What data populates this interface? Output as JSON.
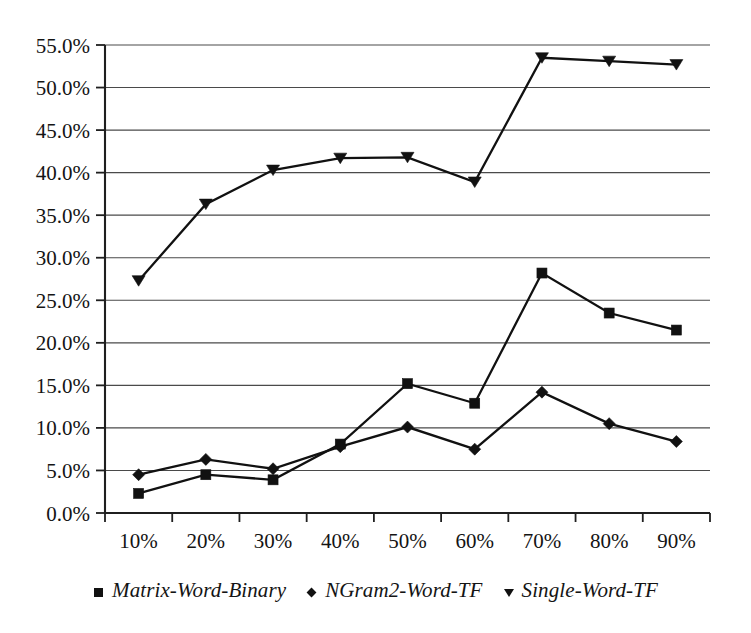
{
  "chart_data": {
    "type": "line",
    "title": "",
    "xlabel": "",
    "ylabel": "",
    "categories": [
      "10%",
      "20%",
      "30%",
      "40%",
      "50%",
      "60%",
      "70%",
      "80%",
      "90%"
    ],
    "x_values": [
      10,
      20,
      30,
      40,
      50,
      60,
      70,
      80,
      90
    ],
    "ylim": [
      0,
      55
    ],
    "ytick_labels": [
      "0.0%",
      "5.0%",
      "10.0%",
      "15.0%",
      "20.0%",
      "25.0%",
      "30.0%",
      "35.0%",
      "40.0%",
      "45.0%",
      "50.0%",
      "55.0%"
    ],
    "ytick_values": [
      0,
      5,
      10,
      15,
      20,
      25,
      30,
      35,
      40,
      45,
      50,
      55
    ],
    "grid": true,
    "legend_position": "bottom",
    "series": [
      {
        "name": "Matrix-Word-Binary",
        "marker": "square",
        "values": [
          2.3,
          4.5,
          3.9,
          8.1,
          15.2,
          12.9,
          28.2,
          23.5,
          21.5
        ]
      },
      {
        "name": "NGram2-Word-TF",
        "marker": "diamond",
        "values": [
          4.5,
          6.3,
          5.2,
          7.8,
          10.1,
          7.5,
          14.2,
          10.5,
          8.4
        ]
      },
      {
        "name": "Single-Word-TF",
        "marker": "triangle-down",
        "values": [
          27.3,
          36.3,
          40.3,
          41.7,
          41.8,
          38.9,
          53.5,
          53.1,
          52.7
        ]
      }
    ]
  },
  "legend": {
    "items": [
      {
        "label": "Matrix-Word-Binary",
        "marker": "square-marker-icon"
      },
      {
        "label": "NGram2-Word-TF",
        "marker": "diamond-marker-icon"
      },
      {
        "label": "Single-Word-TF",
        "marker": "triangle-down-marker-icon"
      }
    ]
  },
  "colors": {
    "series": "#111111",
    "grid": "#4a4a4a",
    "axis": "#1f1f1f",
    "text": "#141414",
    "background": "#ffffff"
  }
}
